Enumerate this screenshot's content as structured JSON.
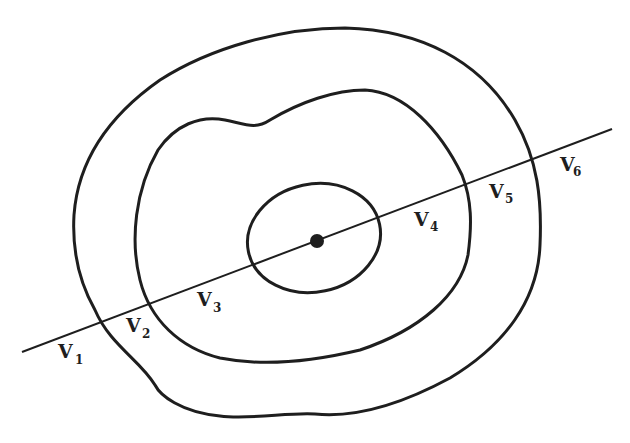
{
  "diagram": {
    "type": "contour-transect",
    "stroke_color": "#1e1e1e",
    "background": "#ffffff",
    "contours": [
      {
        "id": "outer",
        "name": "outer-contour"
      },
      {
        "id": "middle",
        "name": "middle-contour"
      },
      {
        "id": "inner",
        "name": "inner-contour"
      }
    ],
    "center_point": {
      "name": "center-point"
    },
    "transect_line": {
      "name": "transect-line"
    },
    "labels": [
      {
        "main": "V",
        "sub": "1"
      },
      {
        "main": "V",
        "sub": "2"
      },
      {
        "main": "V",
        "sub": "3"
      },
      {
        "main": "V",
        "sub": "4"
      },
      {
        "main": "V",
        "sub": "5"
      },
      {
        "main": "V",
        "sub": "6"
      }
    ]
  }
}
